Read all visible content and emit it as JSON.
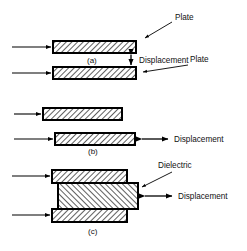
{
  "figure": {
    "type": "technical-diagram",
    "stroke_color": "#000000",
    "hatch_color": "#000000",
    "background_color": "#ffffff"
  },
  "labels": {
    "plate_upper": "Plate",
    "plate_lower": "Plate",
    "dielectric": "Dielectric",
    "displacement_a": "Displacement",
    "displacement_b": "Displacement",
    "displacement_c": "Displacement"
  },
  "captions": {
    "a": "(a)",
    "b": "(b)",
    "c": "(c)"
  },
  "panels": [
    {
      "id": "a",
      "caption": "(a)",
      "arrangement": "variable-gap",
      "displacement_direction": "vertical",
      "displacement_label": "Displacement",
      "elements": [
        {
          "name": "upper-plate",
          "hatch": "forward",
          "x": 53,
          "y": 41,
          "w": 83,
          "h": 12
        },
        {
          "name": "lower-plate",
          "hatch": "forward",
          "x": 53,
          "y": 67,
          "w": 83,
          "h": 12
        }
      ]
    },
    {
      "id": "b",
      "caption": "(b)",
      "arrangement": "variable-overlap-area",
      "displacement_direction": "horizontal",
      "displacement_label": "Displacement",
      "elements": [
        {
          "name": "upper-plate",
          "hatch": "forward",
          "x": 43,
          "y": 108,
          "w": 79,
          "h": 12
        },
        {
          "name": "lower-plate",
          "hatch": "forward",
          "x": 55,
          "y": 133,
          "w": 80,
          "h": 12
        }
      ]
    },
    {
      "id": "c",
      "caption": "(c)",
      "arrangement": "variable-dielectric",
      "displacement_direction": "horizontal",
      "displacement_label": "Displacement",
      "elements": [
        {
          "name": "upper-plate",
          "hatch": "forward",
          "x": 52,
          "y": 170,
          "w": 75,
          "h": 12
        },
        {
          "name": "dielectric-slab",
          "hatch": "backward",
          "x": 58,
          "y": 183,
          "w": 80,
          "h": 26
        },
        {
          "name": "lower-plate",
          "hatch": "forward",
          "x": 52,
          "y": 209,
          "w": 75,
          "h": 12
        }
      ]
    }
  ],
  "leads": [
    {
      "name": "lead-a-upper",
      "x1": 12,
      "y1": 47,
      "x2": 53,
      "y2": 47
    },
    {
      "name": "lead-a-lower",
      "x1": 12,
      "y1": 73,
      "x2": 53,
      "y2": 73
    },
    {
      "name": "lead-b-upper",
      "x1": 14,
      "y1": 114,
      "x2": 43,
      "y2": 114
    },
    {
      "name": "lead-b-lower",
      "x1": 14,
      "y1": 139,
      "x2": 55,
      "y2": 139
    },
    {
      "name": "lead-c-upper",
      "x1": 12,
      "y1": 176,
      "x2": 52,
      "y2": 176
    },
    {
      "name": "lead-c-lower",
      "x1": 12,
      "y1": 215,
      "x2": 52,
      "y2": 215
    }
  ]
}
